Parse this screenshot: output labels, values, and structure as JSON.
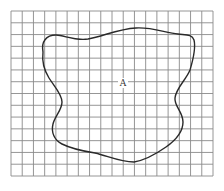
{
  "figure": {
    "background": "#ffffff",
    "grid": {
      "columns": 18,
      "rows": 14,
      "left": 11,
      "top": 11,
      "right": 213,
      "bottom": 176,
      "line_color": "#8a8a8a",
      "line_width": 0.9
    },
    "region": {
      "label": "A",
      "label_x": 123,
      "label_y": 86,
      "stroke": "#2a2a2a",
      "stroke_width": 1.4,
      "path": "M 43 52 C 41 42, 46 35, 56 35 C 64 35, 74 41, 88 39 C 104 36, 118 29, 136 28 C 152 27, 166 33, 178 34 C 186 35, 192 34, 194 40 C 196 48, 193 60, 190 70 C 186 80, 176 88, 175 98 C 174 106, 183 112, 183 122 C 183 132, 176 140, 166 147 C 156 154, 146 160, 134 162 C 120 162, 108 156, 95 153 C 82 151, 70 148, 62 144 C 54 140, 51 132, 53 124 C 55 116, 62 110, 62 102 C 62 94, 54 86, 49 78 C 44 70, 42 60, 43 52 Z"
    }
  }
}
